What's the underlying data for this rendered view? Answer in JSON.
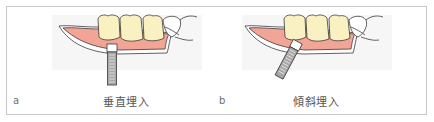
{
  "panels": [
    {
      "letter": "a",
      "caption": "垂直埋入",
      "implant_orientation": "vertical"
    },
    {
      "letter": "b",
      "caption": "傾斜埋入",
      "implant_orientation": "tilted"
    }
  ],
  "colors": {
    "gingiva": "#f2a597",
    "tooth": "#faf1c2",
    "outline": "#3a3a3a",
    "implant_body": "#a8a8a8",
    "implant_collar": "#ffffff",
    "frame": "#c8c8c8",
    "background_shade": "#f6f6f6"
  }
}
